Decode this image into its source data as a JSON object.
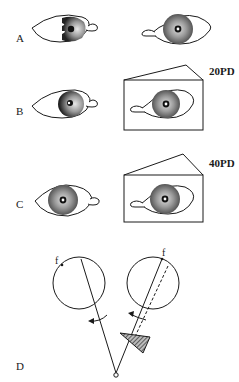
{
  "panels": [
    {
      "label": "A",
      "prism": null
    },
    {
      "label": "B",
      "prism": "20PD"
    },
    {
      "label": "C",
      "prism": "40PD"
    },
    {
      "label": "D",
      "prism": null
    }
  ],
  "panel_d": {
    "left_eye_marker": "f",
    "right_eye_marker": "f"
  },
  "colors": {
    "line": "#1a1a1a",
    "iris_light": "#d8d8d8",
    "iris_dark": "#5a5a5a",
    "prism_fill": "#666666"
  }
}
